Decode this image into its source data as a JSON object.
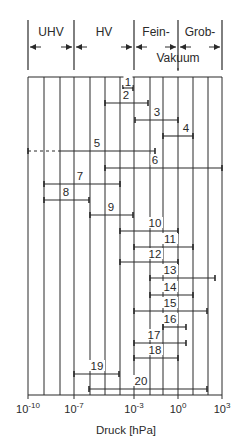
{
  "diagram": {
    "type": "range-chart",
    "regions": [
      {
        "label": "UHV",
        "x1": 28,
        "x2": 74
      },
      {
        "label": "HV",
        "x1": 74,
        "x2": 134
      },
      {
        "label": "Fein-",
        "x1": 134,
        "x2": 178
      },
      {
        "label": "Grob-",
        "x1": 178,
        "x2": 222
      }
    ],
    "region_sublabel": "Vakuum",
    "xaxis": {
      "label": "Druck [hPa]",
      "ticks": [
        {
          "base": "10",
          "exp": "-10",
          "x": 28
        },
        {
          "base": "10",
          "exp": "-7",
          "x": 74
        },
        {
          "base": "10",
          "exp": "-3",
          "x": 134
        },
        {
          "base": "10",
          "exp": "0",
          "x": 178
        },
        {
          "base": "10",
          "exp": "3",
          "x": 222
        }
      ]
    },
    "grid_x": [
      28,
      44,
      60,
      74,
      90,
      105,
      120,
      134,
      150,
      163,
      178,
      193,
      208,
      222
    ],
    "bars": [
      {
        "label": "1",
        "x1": 123,
        "x2": 133,
        "y": 88,
        "lx": 128,
        "ly": 86
      },
      {
        "label": "2",
        "x1": 105,
        "x2": 148,
        "y": 103,
        "lx": 126,
        "ly": 99
      },
      {
        "label": "3",
        "x1": 135,
        "x2": 178,
        "y": 120,
        "lx": 157,
        "ly": 116
      },
      {
        "label": "4",
        "x1": 163,
        "x2": 193,
        "y": 136,
        "lx": 186,
        "ly": 132
      },
      {
        "label": "5",
        "x1": 60,
        "x2": 155,
        "y": 151,
        "lx": 97,
        "ly": 147,
        "dotted_from": 28
      },
      {
        "label": "6",
        "x1": 105,
        "x2": 222,
        "y": 168,
        "lx": 155,
        "ly": 164
      },
      {
        "label": "7",
        "x1": 44,
        "x2": 120,
        "y": 184,
        "lx": 80,
        "ly": 180
      },
      {
        "label": "8",
        "x1": 44,
        "x2": 89,
        "y": 200,
        "lx": 66,
        "ly": 196
      },
      {
        "label": "9",
        "x1": 90,
        "x2": 133,
        "y": 215,
        "lx": 111,
        "ly": 211
      },
      {
        "label": "10",
        "x1": 120,
        "x2": 178,
        "y": 231,
        "lx": 155,
        "ly": 227
      },
      {
        "label": "11",
        "x1": 134,
        "x2": 193,
        "y": 247,
        "lx": 170,
        "ly": 243
      },
      {
        "label": "12",
        "x1": 120,
        "x2": 178,
        "y": 262,
        "lx": 155,
        "ly": 258
      },
      {
        "label": "13",
        "x1": 150,
        "x2": 215,
        "y": 278,
        "lx": 170,
        "ly": 274
      },
      {
        "label": "14",
        "x1": 150,
        "x2": 193,
        "y": 295,
        "lx": 170,
        "ly": 291
      },
      {
        "label": "15",
        "x1": 134,
        "x2": 207,
        "y": 311,
        "lx": 170,
        "ly": 307
      },
      {
        "label": "16",
        "x1": 163,
        "x2": 186,
        "y": 327,
        "lx": 170,
        "ly": 323
      },
      {
        "label": "17",
        "x1": 134,
        "x2": 186,
        "y": 343,
        "lx": 154,
        "ly": 339
      },
      {
        "label": "18",
        "x1": 134,
        "x2": 178,
        "y": 358,
        "lx": 155,
        "ly": 354
      },
      {
        "label": "19",
        "x1": 74,
        "x2": 119,
        "y": 374,
        "lx": 97,
        "ly": 370
      },
      {
        "label": "20",
        "x1": 89,
        "x2": 207,
        "y": 389,
        "lx": 141,
        "ly": 385
      }
    ],
    "colors": {
      "line": "#2a2a2a",
      "background": "#ffffff"
    }
  }
}
